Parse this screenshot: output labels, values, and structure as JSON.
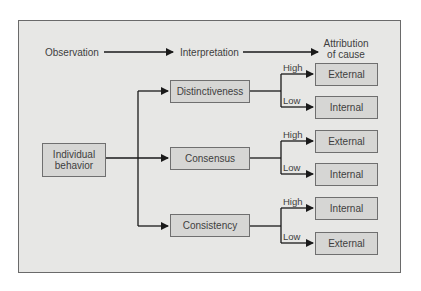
{
  "header": {
    "observation": "Observation",
    "interpretation": "Interpretation",
    "attribution_line1": "Attribution",
    "attribution_line2": "of cause"
  },
  "source": {
    "line1": "Individual",
    "line2": "behavior"
  },
  "factors": [
    {
      "label": "Distinctiveness",
      "branches": [
        {
          "level": "High",
          "outcome": "External"
        },
        {
          "level": "Low",
          "outcome": "Internal"
        }
      ]
    },
    {
      "label": "Consensus",
      "branches": [
        {
          "level": "High",
          "outcome": "External"
        },
        {
          "level": "Low",
          "outcome": "Internal"
        }
      ]
    },
    {
      "label": "Consistency",
      "branches": [
        {
          "level": "High",
          "outcome": "Internal"
        },
        {
          "level": "Low",
          "outcome": "External"
        }
      ]
    }
  ],
  "colors": {
    "panel": "#e7e7e5",
    "box": "#d6d6d4",
    "line": "#1a1a1a"
  }
}
